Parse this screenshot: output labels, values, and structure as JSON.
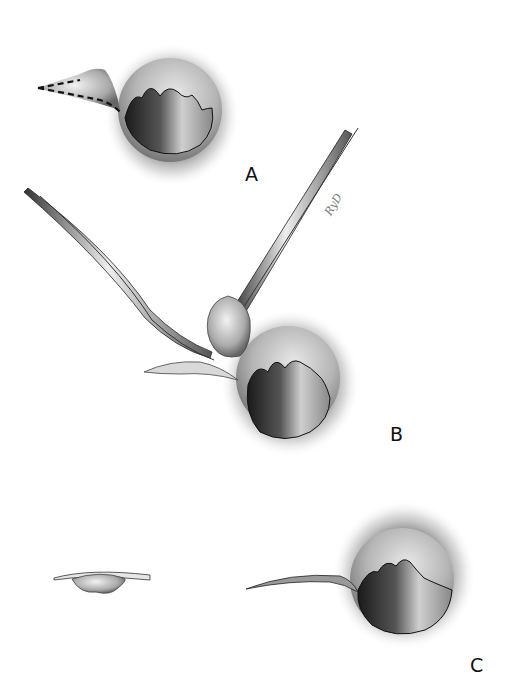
{
  "figure": {
    "panels": [
      {
        "label": "A",
        "description": "anal canal with external hemorrhoid outlined by dashed incision line"
      },
      {
        "label": "B",
        "description": "hemorrhoid grasped with forceps and excised with curved scissors"
      },
      {
        "label": "C",
        "description": "excised hemorrhoid specimen and resulting wound"
      }
    ],
    "signature": "RyD",
    "colors": {
      "background": "#ffffff",
      "ink": "#111111",
      "shade": "#3a3a3a"
    }
  }
}
